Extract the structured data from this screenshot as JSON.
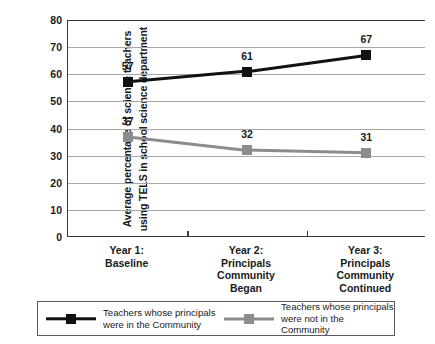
{
  "chart_data": {
    "type": "line",
    "title": "",
    "xlabel": "",
    "ylabel": "Average percentage of science teachers using TELS in school science department",
    "ylabel_lines": [
      "Average percentage of science teachers",
      "using TELS in school science department"
    ],
    "categories": [
      "Year 1:\nBaseline",
      "Year 2:\nPrincipals\nCommunity\nBegan",
      "Year 3:\nPrincipals\nCommunity\nContinued"
    ],
    "ylim": [
      0,
      80
    ],
    "yticks": [
      80,
      70,
      60,
      50,
      40,
      30,
      20,
      10,
      0
    ],
    "grid": true,
    "legend_position": "bottom",
    "series": [
      {
        "name": "Teachers whose principals were in the Community",
        "legend_lines": "Teachers whose principals\nwere in the Community",
        "color": "#111111",
        "marker": "square",
        "values": [
          57,
          61,
          67
        ],
        "labels": [
          "57",
          "61",
          "67"
        ]
      },
      {
        "name": "Teachers whose principals were not in the Community",
        "legend_lines": "Teachers whose principals\nwere not in the Community",
        "color": "#8c8c8c",
        "marker": "square",
        "values": [
          37,
          32,
          31
        ],
        "labels": [
          "37",
          "32",
          "31"
        ]
      }
    ]
  }
}
